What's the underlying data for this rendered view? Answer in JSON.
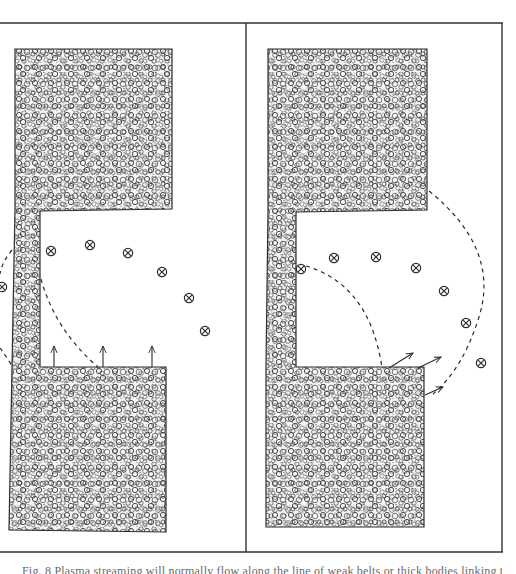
{
  "figure": {
    "caption": "Fig. 8 Plasma streaming will normally flow along the line of weak belts or thick bodies linking two",
    "caption_visible_fraction": "top half only (clipped at image bottom)",
    "panels": [
      {
        "id": "left",
        "description": "Left panel: C-shaped granular (stippled) mass; vertical arrows rising from lower block; row of crossed-circle markers arcing to the right; dashed quarter arc from stem down to lower block; partial dashed arc at left edge",
        "markers": [
          {
            "x": 51,
            "y": 251
          },
          {
            "x": 90,
            "y": 245
          },
          {
            "x": 128,
            "y": 253
          },
          {
            "x": 162,
            "y": 272
          },
          {
            "x": 189,
            "y": 298
          },
          {
            "x": 205,
            "y": 331
          }
        ],
        "edge_markers": [
          {
            "x": 3,
            "y": 287
          },
          {
            "x": 3,
            "y": 263
          }
        ],
        "arrows": [
          {
            "x1": 54,
            "y1": 367,
            "x2": 54,
            "y2": 347
          },
          {
            "x1": 103,
            "y1": 367,
            "x2": 103,
            "y2": 347
          },
          {
            "x1": 152,
            "y1": 367,
            "x2": 152,
            "y2": 347
          }
        ]
      },
      {
        "id": "right",
        "description": "Right panel: C-shaped granular mass with wider stem; diagonal arrows leaving lower block toward upper right; crossed-circle markers in wider arc; two dashed arcs (inner from stem to lower block, outer from upper block corner to lower block corner)",
        "markers": [
          {
            "x": 301,
            "y": 269
          },
          {
            "x": 334,
            "y": 258
          },
          {
            "x": 376,
            "y": 257
          },
          {
            "x": 416,
            "y": 268
          },
          {
            "x": 444,
            "y": 291
          },
          {
            "x": 466,
            "y": 323
          },
          {
            "x": 481,
            "y": 363
          }
        ],
        "arrows": [
          {
            "x1": 389,
            "y1": 368,
            "x2": 413,
            "y2": 353
          },
          {
            "x1": 418,
            "y1": 368,
            "x2": 441,
            "y2": 357
          },
          {
            "x1": 426,
            "y1": 395,
            "x2": 443,
            "y2": 387
          }
        ]
      }
    ],
    "colors": {
      "ink": "#2b2b2b",
      "paper": "#ffffff",
      "stipple_light": "#d9d9d9",
      "caption": "#6a6a6a"
    }
  }
}
